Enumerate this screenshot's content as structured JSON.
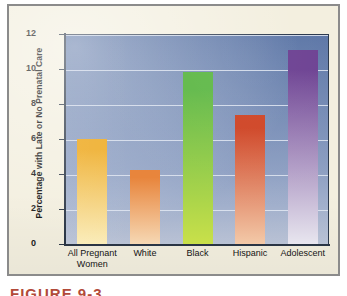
{
  "figure": {
    "caption_fragment": "FIGURE 9-3",
    "panel_background": "#f3efdf",
    "frame_color": "#8b8b8b"
  },
  "chart_data": {
    "type": "bar",
    "title": "",
    "xlabel": "",
    "ylabel": "Percentage with Late or No Prenatal Care",
    "ylim": [
      0,
      12
    ],
    "yticks": [
      0,
      2,
      4,
      6,
      8,
      10,
      12
    ],
    "ytick_labels": [
      "0",
      "2",
      "4",
      "6",
      "8",
      "10",
      "12"
    ],
    "grid": true,
    "legend": "none",
    "categories": [
      "All Pregnant Women",
      "White",
      "Black",
      "Hispanic",
      "Adolescent"
    ],
    "category_lines": [
      [
        "All Pregnant",
        "Women"
      ],
      [
        "White"
      ],
      [
        "Black"
      ],
      [
        "Hispanic"
      ],
      [
        "Adolescent"
      ]
    ],
    "values": [
      6.0,
      4.25,
      9.85,
      7.4,
      11.1
    ],
    "bar_colors_top": [
      "#f0b43c",
      "#e8853c",
      "#61b94a",
      "#cf4526",
      "#6b3f91"
    ],
    "bar_colors_bottom": [
      "#faecb8",
      "#f6d8b4",
      "#c9e04a",
      "#f3c9a8",
      "#e8e6ef"
    ],
    "plot_background_top": "#5a74a5",
    "plot_background_bottom": "#bdc6d9",
    "gridline_color": "#e2e8f2",
    "axis_color": "#2b3646"
  }
}
